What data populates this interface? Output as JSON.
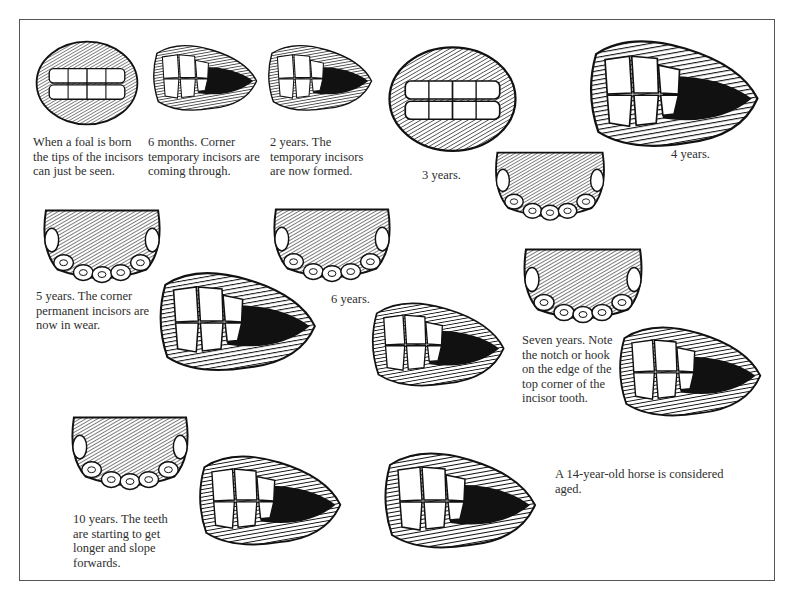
{
  "figure": {
    "title_visible": false,
    "frame_color": "#555555",
    "ink_color": "#111111",
    "paper_color": "#ffffff"
  },
  "stages": [
    {
      "id": "newborn",
      "age": "Newborn foal",
      "view": "front",
      "caption": "When a foal is born\nthe tips of the incisors\ncan just be seen."
    },
    {
      "id": "6-months",
      "age": "6 months",
      "view": "side",
      "caption": "6 months.  Corner\ntemporary incisors are\ncoming through."
    },
    {
      "id": "2-years",
      "age": "2 years",
      "view": "side",
      "caption": "2 years.  The\ntemporary incisors\nare now formed."
    },
    {
      "id": "3-years",
      "age": "3 years",
      "view": "front",
      "caption": "3 years."
    },
    {
      "id": "4-years",
      "age": "4 years",
      "view": "side + table",
      "caption": "4 years."
    },
    {
      "id": "5-years",
      "age": "5 years",
      "view": "table + side",
      "caption": "5 years. The corner\npermanent incisors are\nnow in wear."
    },
    {
      "id": "6-years",
      "age": "6 years",
      "view": "table + side",
      "caption": "6 years."
    },
    {
      "id": "7-years",
      "age": "7 years",
      "view": "table + side",
      "caption": "Seven years. Note\nthe notch or hook\non the edge of the\ntop corner of the\nincisor tooth."
    },
    {
      "id": "10-years",
      "age": "10 years",
      "view": "table + side",
      "caption": "10 years.  The teeth\nare starting to get\nlonger and slope\nforwards."
    },
    {
      "id": "14-years",
      "age": "14 years",
      "view": "side",
      "caption": "A 14-year-old horse is considered\naged."
    }
  ]
}
